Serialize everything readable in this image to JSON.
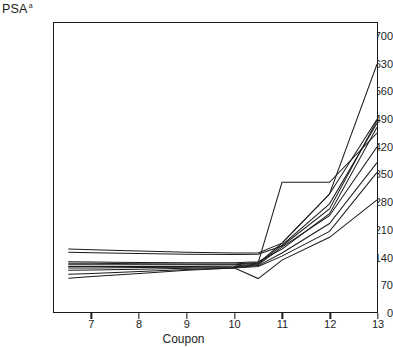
{
  "chart_data": {
    "type": "line",
    "title": "",
    "ylabel": "PSA",
    "ylabel_superscript": "a",
    "xlabel": "Coupon",
    "xlim": [
      6.2,
      13.0
    ],
    "ylim": [
      0,
      735
    ],
    "grid": false,
    "legend": "none",
    "x_ticks": [
      7,
      8,
      9,
      10,
      11,
      12,
      13
    ],
    "y_ticks": [
      0,
      70,
      140,
      210,
      280,
      350,
      420,
      490,
      560,
      630,
      700
    ],
    "x": [
      6.5,
      7,
      8,
      9,
      10,
      10.5,
      11,
      12,
      13
    ],
    "series": [
      {
        "name": "series-1",
        "values": [
          160,
          158,
          155,
          152,
          150,
          150,
          175,
          300,
          630
        ]
      },
      {
        "name": "series-2",
        "values": [
          152,
          151,
          149,
          147,
          146,
          147,
          168,
          262,
          487
        ]
      },
      {
        "name": "series-3",
        "values": [
          128,
          127,
          126,
          125,
          125,
          128,
          160,
          250,
          470
        ]
      },
      {
        "name": "series-4",
        "values": [
          124,
          124,
          123,
          122,
          122,
          126,
          330,
          330,
          455
        ]
      },
      {
        "name": "series-5",
        "values": [
          120,
          120,
          120,
          120,
          120,
          124,
          175,
          300,
          490
        ]
      },
      {
        "name": "series-6",
        "values": [
          116,
          116,
          116,
          116,
          117,
          122,
          170,
          275,
          480
        ]
      },
      {
        "name": "series-7",
        "values": [
          112,
          112,
          113,
          114,
          115,
          120,
          165,
          245,
          420
        ]
      },
      {
        "name": "series-8",
        "values": [
          106,
          107,
          109,
          111,
          113,
          118,
          150,
          225,
          380
        ]
      },
      {
        "name": "series-9",
        "values": [
          96,
          98,
          103,
          108,
          112,
          116,
          142,
          205,
          355
        ]
      },
      {
        "name": "series-10",
        "values": [
          86,
          90,
          98,
          106,
          112,
          85,
          132,
          190,
          285
        ]
      }
    ]
  }
}
